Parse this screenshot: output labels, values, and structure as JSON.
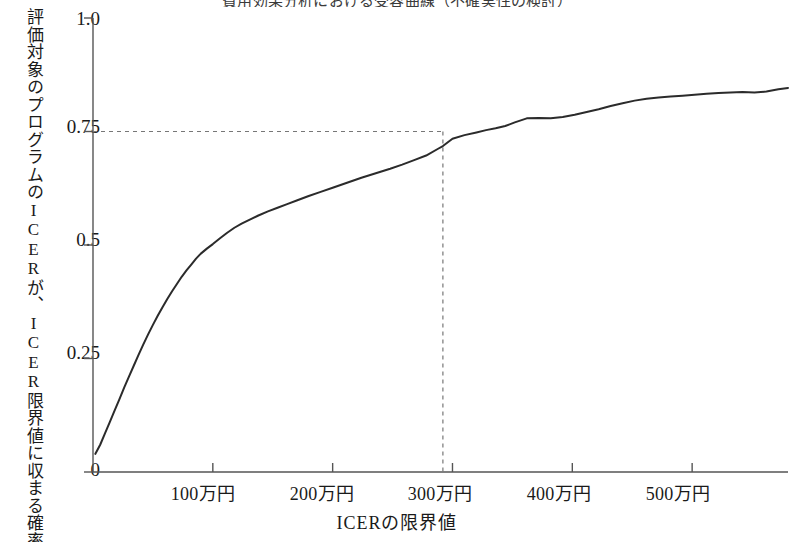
{
  "figure": {
    "title": "費用効果分析における受容曲線（不確実性の検討）",
    "title_clipped": true,
    "background_color": "#ffffff",
    "line_color": "#2b2b2b",
    "axis_color": "#555555",
    "guide_color": "#777777"
  },
  "chart_data": {
    "type": "line",
    "title": "費用効果分析における受容曲線（不確実性の検討）",
    "xlabel": "ICERの限界値",
    "ylabel": "評価対象のプログラムのICERが、ICER限界値に収まる確率",
    "xlim": [
      0,
      580
    ],
    "ylim": [
      0,
      1.0
    ],
    "x_unit": "万円",
    "grid": false,
    "legend": null,
    "x_tick_values": [
      100,
      200,
      300,
      400,
      500
    ],
    "x_tick_labels": [
      "100万円",
      "200万円",
      "300万円",
      "400万円",
      "500万円"
    ],
    "y_tick_values": [
      0,
      0.25,
      0.5,
      0.75,
      1.0
    ],
    "y_tick_labels": [
      "0",
      "0.25",
      "0.5",
      "0.75",
      "1.0"
    ],
    "annotations": [
      {
        "name": "threshold-guide",
        "style": "dashed",
        "x": 292,
        "y": 0.75,
        "description": "ICER限界値 約300万円で確率0.75に到達"
      }
    ],
    "series": [
      {
        "name": "受容曲線",
        "x": [
          2,
          6,
          10,
          14,
          18,
          22,
          26,
          30,
          34,
          38,
          42,
          46,
          50,
          54,
          58,
          62,
          66,
          70,
          74,
          78,
          82,
          86,
          90,
          95,
          100,
          106,
          112,
          118,
          124,
          130,
          138,
          146,
          154,
          162,
          170,
          180,
          190,
          200,
          212,
          224,
          236,
          248,
          258,
          268,
          278,
          288,
          292,
          300,
          310,
          320,
          328,
          336,
          344,
          352,
          362,
          372,
          382,
          392,
          402,
          412,
          422,
          432,
          442,
          452,
          462,
          472,
          482,
          492,
          502,
          512,
          522,
          532,
          542,
          552,
          562,
          572,
          580
        ],
        "y": [
          0.04,
          0.06,
          0.085,
          0.11,
          0.135,
          0.16,
          0.186,
          0.21,
          0.234,
          0.258,
          0.281,
          0.303,
          0.324,
          0.344,
          0.363,
          0.381,
          0.398,
          0.414,
          0.43,
          0.444,
          0.457,
          0.47,
          0.481,
          0.492,
          0.502,
          0.515,
          0.527,
          0.538,
          0.547,
          0.555,
          0.565,
          0.574,
          0.582,
          0.59,
          0.598,
          0.608,
          0.617,
          0.626,
          0.637,
          0.648,
          0.658,
          0.668,
          0.677,
          0.687,
          0.697,
          0.712,
          0.718,
          0.734,
          0.742,
          0.748,
          0.753,
          0.757,
          0.762,
          0.77,
          0.779,
          0.78,
          0.779,
          0.782,
          0.787,
          0.793,
          0.799,
          0.806,
          0.812,
          0.818,
          0.822,
          0.825,
          0.827,
          0.829,
          0.831,
          0.833,
          0.835,
          0.836,
          0.837,
          0.836,
          0.838,
          0.843,
          0.846
        ]
      }
    ]
  },
  "axes": {
    "y_ticks": [
      {
        "label": "1.0",
        "value": 1.0
      },
      {
        "label": "0.75",
        "value": 0.75
      },
      {
        "label": "0.5",
        "value": 0.5
      },
      {
        "label": "0.25",
        "value": 0.25
      },
      {
        "label": "0",
        "value": 0
      }
    ],
    "x_ticks": [
      {
        "label": "100万円",
        "value": 100
      },
      {
        "label": "200万円",
        "value": 200
      },
      {
        "label": "300万円",
        "value": 300
      },
      {
        "label": "400万円",
        "value": 400
      },
      {
        "label": "500万円",
        "value": 500
      }
    ]
  }
}
